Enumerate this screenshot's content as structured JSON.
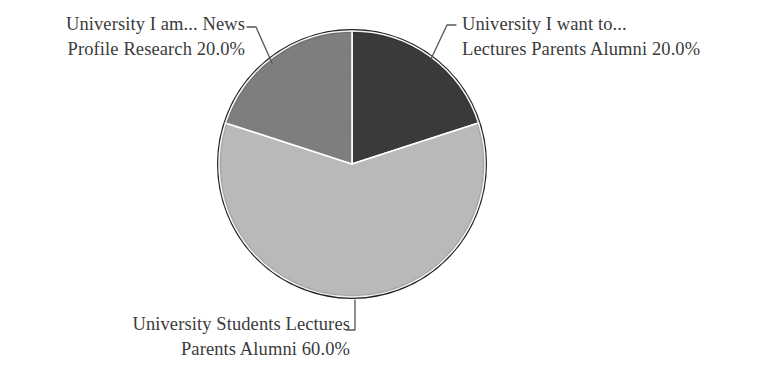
{
  "figure": {
    "background_color": "#ffffff",
    "text_color": "#3b3b3b",
    "leader_line_color": "#555555",
    "slice_edge_color": "#ffffff",
    "outline_color": "#1a1a1a"
  },
  "chart_data": {
    "type": "pie",
    "title": "",
    "subtitle": "",
    "xlabel": "",
    "ylabel": "",
    "legend_position": "none",
    "grid": false,
    "start_angle_deg": 90,
    "direction": "clockwise",
    "units": "percent",
    "center": {
      "x": 352,
      "y": 164
    },
    "radius": 133,
    "categories": [
      "University I want to... Lectures Parents Alumni",
      "University Students Lectures Parents Alumni",
      "University I am... News Profile Research"
    ],
    "values": [
      20.0,
      60.0,
      20.0
    ],
    "colors": [
      "#3a3a3a",
      "#b9b9b9",
      "#7e7e7e"
    ],
    "slices": [
      {
        "name": "University I want to... Lectures Parents Alumni",
        "value": 20.0,
        "value_label": "20.0%",
        "color": "#3a3a3a",
        "start_deg": 0,
        "end_deg": 72,
        "label_lines": [
          "University I want to...",
          "Lectures Parents Alumni 20.0%"
        ],
        "label_position": "upper-right"
      },
      {
        "name": "University Students Lectures Parents Alumni",
        "value": 60.0,
        "value_label": "60.0%",
        "color": "#b9b9b9",
        "start_deg": 72,
        "end_deg": 288,
        "label_lines": [
          "University Students Lectures",
          "Parents Alumni 60.0%"
        ],
        "label_position": "bottom"
      },
      {
        "name": "University I am... News Profile Research",
        "value": 20.0,
        "value_label": "20.0%",
        "color": "#7e7e7e",
        "start_deg": 288,
        "end_deg": 360,
        "label_lines": [
          "University I am... News",
          "Profile Research 20.0%"
        ],
        "label_position": "upper-left"
      }
    ]
  },
  "labels": {
    "news": {
      "line1": "University I am... News",
      "line2": "Profile Research 20.0%"
    },
    "want": {
      "line1": "University I want to...",
      "line2": "Lectures Parents Alumni 20.0%"
    },
    "students": {
      "line1": "University Students Lectures",
      "line2": "Parents Alumni 60.0%"
    }
  }
}
